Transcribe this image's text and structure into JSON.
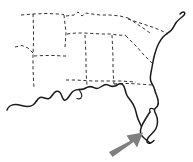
{
  "figure": {
    "width": 193,
    "height": 162,
    "background_color": "#ffffff",
    "caption": ""
  },
  "style": {
    "coastline_color": "#1a1a1a",
    "coastline_width": 1.5,
    "state_border_color": "#333333",
    "state_border_width": 1,
    "state_border_dash": "3.2 2.6",
    "arrow_color": "#7f7f7f"
  },
  "map": {
    "region_name": "Southeastern United States",
    "features": [
      {
        "name": "atlantic-coastline",
        "type": "coastline",
        "description": "Solid Atlantic coast from Mid-Atlantic down around Florida"
      },
      {
        "name": "gulf-coastline",
        "type": "coastline",
        "description": "Solid Gulf of Mexico coast from Texas east to Florida panhandle"
      },
      {
        "name": "florida-peninsula",
        "type": "coastline",
        "description": "Florida peninsula outline tapering to southern tip"
      },
      {
        "name": "state-borders",
        "type": "boundary",
        "description": "Dashed interior state boundary lines"
      }
    ],
    "annotation": {
      "name": "pointer-arrow",
      "type": "arrow",
      "color": "#7f7f7f",
      "direction": "up-right",
      "points_at": "south-florida",
      "label": ""
    }
  }
}
